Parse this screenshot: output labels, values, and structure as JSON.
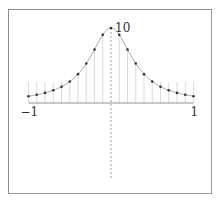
{
  "chart_data": {
    "type": "line",
    "title": "",
    "xlabel": "",
    "ylabel": "",
    "function": "10/(1+10x^2)",
    "xlim": [
      -1,
      1
    ],
    "ylim": [
      0,
      10
    ],
    "tick_labels": {
      "x_min": "−1",
      "x_max": "1",
      "y_peak": "10"
    },
    "x": [
      -1.0,
      -0.9,
      -0.8,
      -0.7,
      -0.6,
      -0.5,
      -0.4,
      -0.3,
      -0.2,
      -0.1,
      0.0,
      0.1,
      0.2,
      0.3,
      0.4,
      0.5,
      0.6,
      0.7,
      0.8,
      0.9,
      1.0
    ],
    "values": [
      0.91,
      1.1,
      1.35,
      1.69,
      2.17,
      2.86,
      3.85,
      5.26,
      7.14,
      9.09,
      10.0,
      9.09,
      7.14,
      5.26,
      3.85,
      2.86,
      2.17,
      1.69,
      1.35,
      1.1,
      0.91
    ],
    "grid": false,
    "legend": null,
    "markers": "dots with vertical stems to x-axis",
    "colors": {
      "curve": "#999999",
      "points": "#333333",
      "stems": "#cccccc",
      "axes": "#777777"
    }
  }
}
